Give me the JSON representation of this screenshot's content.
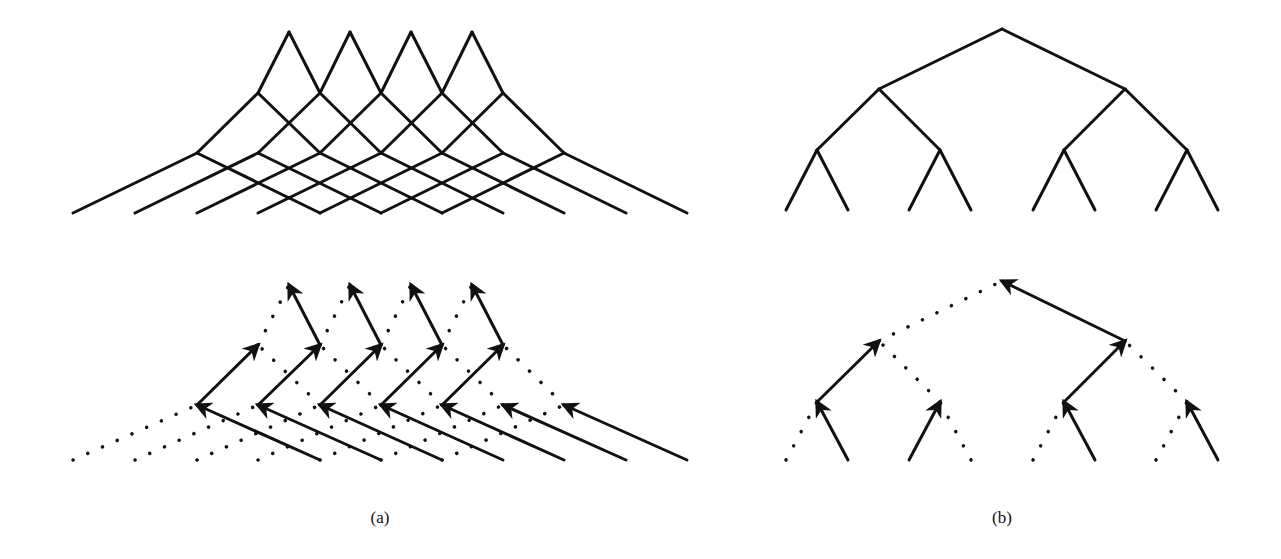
{
  "colors": {
    "ink": "#111111",
    "background": "#ffffff"
  },
  "labels": [
    {
      "id": "a",
      "text": "(a)",
      "x": 380,
      "y": 508
    },
    {
      "id": "b",
      "text": "(b)",
      "x": 1002,
      "y": 508
    }
  ],
  "panel_a": {
    "description": "Overlapping binary trees (lattice) and their parent-pointer forest",
    "levels_x": [
      [
        289,
        350,
        411,
        472
      ],
      [
        258,
        320,
        381,
        442,
        503
      ],
      [
        197,
        258,
        320,
        381,
        442,
        503,
        564
      ],
      [
        73,
        135,
        197,
        258,
        320,
        381,
        442,
        503,
        564,
        626,
        687
      ]
    ],
    "top_y": [
      32,
      93,
      153,
      213
    ],
    "bottom_y": [
      285,
      345,
      405,
      460
    ],
    "child_offsets": [
      31,
      61,
      124
    ]
  },
  "panel_b": {
    "description": "Complete binary tree and its parent-pointer forest",
    "levels_x": [
      [
        1002
      ],
      [
        879,
        1125
      ],
      [
        817,
        940,
        1064,
        1187
      ],
      [
        786,
        848,
        909,
        971,
        1033,
        1095,
        1156,
        1218
      ]
    ],
    "top_y": [
      29,
      89,
      150,
      210
    ],
    "bottom_y": [
      281,
      341,
      402,
      460
    ],
    "solid_edges_bottom": [
      [
        [
          3,
          1
        ],
        [
          2,
          0
        ]
      ],
      [
        [
          2,
          0
        ],
        [
          1,
          0
        ]
      ],
      [
        [
          3,
          2
        ],
        [
          2,
          1
        ]
      ],
      [
        [
          3,
          5
        ],
        [
          2,
          2
        ]
      ],
      [
        [
          2,
          2
        ],
        [
          1,
          1
        ]
      ],
      [
        [
          1,
          1
        ],
        [
          0,
          0
        ]
      ],
      [
        [
          3,
          7
        ],
        [
          2,
          3
        ]
      ]
    ]
  }
}
